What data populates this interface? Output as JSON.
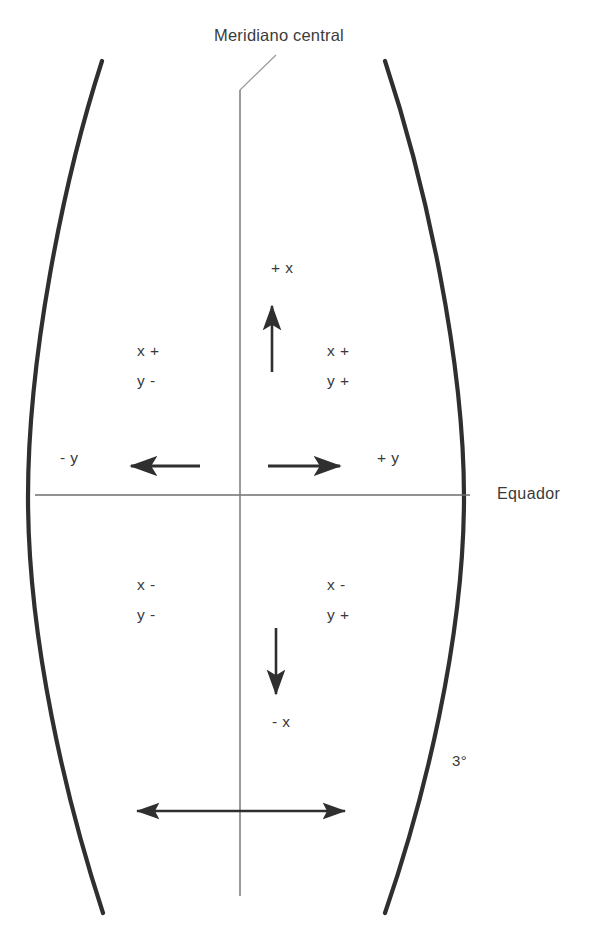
{
  "figure": {
    "type": "diagram",
    "background_color": "#ffffff",
    "stroke_color": "#2f2f2f",
    "thin_stroke_color": "#6e6e6e",
    "text_color": "#3a3a3a"
  },
  "labels": {
    "title": "Meridiano central",
    "equator": "Equador",
    "zone_width": "3°",
    "axis_up": "+ x",
    "axis_down": "- x",
    "axis_left": "- y",
    "axis_right": "+ y"
  },
  "quadrants": [
    {
      "name": "upper-left",
      "x_sign": "x +",
      "y_sign": "y -"
    },
    {
      "name": "upper-right",
      "x_sign": "x +",
      "y_sign": "y +"
    },
    {
      "name": "lower-left",
      "x_sign": "x -",
      "y_sign": "y -"
    },
    {
      "name": "lower-right",
      "x_sign": "x -",
      "y_sign": "y +"
    }
  ],
  "geometry": {
    "central_meridian": {
      "x": 240,
      "y_top": 90,
      "y_bottom": 896
    },
    "equator": {
      "y": 495,
      "x_left": 35,
      "x_right": 470
    },
    "left_boundary": {
      "x_top": 102,
      "y_top": 61,
      "x_mid": 28,
      "y_mid": 497,
      "x_bottom": 103,
      "y_bottom": 913
    },
    "right_boundary": {
      "x_top": 385,
      "y_top": 61,
      "x_mid": 464,
      "y_mid": 497,
      "x_bottom": 385,
      "y_bottom": 913
    },
    "width_arrow": {
      "y": 811,
      "x_left": 137,
      "x_right": 345
    }
  }
}
